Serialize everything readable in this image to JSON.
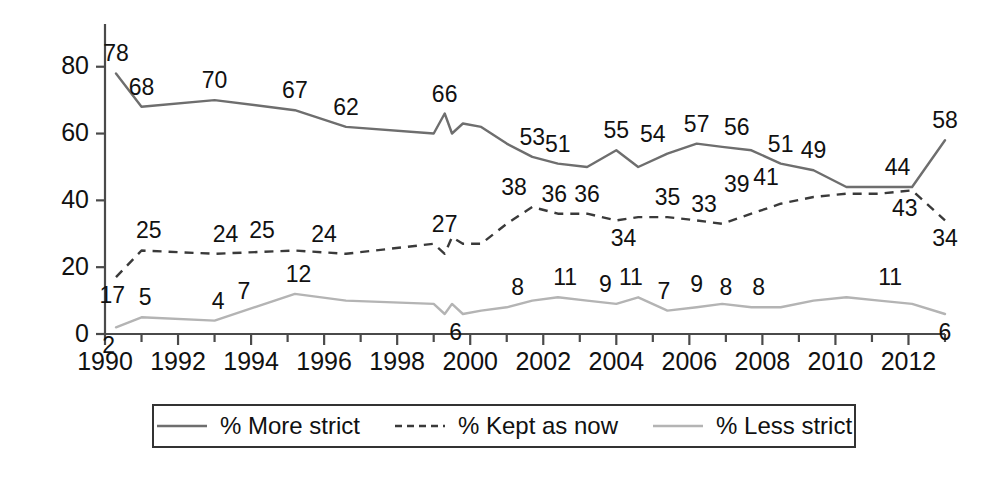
{
  "chart_data": {
    "type": "line",
    "title": "",
    "subtitle": "",
    "xlabel": "",
    "ylabel": "",
    "xlim": [
      1990,
      2013
    ],
    "ylim": [
      0,
      88
    ],
    "yticks": [
      0,
      20,
      40,
      60,
      80
    ],
    "xticks": [
      1990,
      1992,
      1994,
      1996,
      1998,
      2000,
      2002,
      2004,
      2006,
      2008,
      2010,
      2012
    ],
    "grid": false,
    "legend_position": "bottom",
    "x": [
      1990.3,
      1991.0,
      1993.0,
      1995.2,
      1996.6,
      1999.0,
      1999.3,
      1999.5,
      1999.8,
      2000.3,
      2001.0,
      2001.7,
      2002.4,
      2003.2,
      2004.0,
      2004.6,
      2005.4,
      2006.2,
      2006.9,
      2007.7,
      2008.5,
      2009.4,
      2010.3,
      2011.2,
      2012.1,
      2013.0
    ],
    "series": [
      {
        "name": "% More strict",
        "key": "more_strict",
        "color": "#6e6e6e",
        "style": "solid",
        "values": [
          78,
          68,
          70,
          67,
          62,
          60,
          66,
          60,
          63,
          62,
          57,
          53,
          51,
          50,
          55,
          50,
          54,
          57,
          56,
          55,
          51,
          49,
          44,
          44,
          44,
          58
        ],
        "labels": [
          {
            "x": 1990.3,
            "y": 78,
            "text": "78"
          },
          {
            "x": 1991.0,
            "y": 68,
            "text": "68"
          },
          {
            "x": 1993.0,
            "y": 70,
            "text": "70"
          },
          {
            "x": 1995.2,
            "y": 67,
            "text": "67"
          },
          {
            "x": 1996.6,
            "y": 62,
            "text": "62"
          },
          {
            "x": 1999.3,
            "y": 66,
            "text": "66"
          },
          {
            "x": 2001.7,
            "y": 53,
            "text": "53"
          },
          {
            "x": 2002.4,
            "y": 51,
            "text": "51"
          },
          {
            "x": 2004.0,
            "y": 55,
            "text": "55"
          },
          {
            "x": 2005.0,
            "y": 54,
            "text": "54"
          },
          {
            "x": 2006.2,
            "y": 57,
            "text": "57"
          },
          {
            "x": 2007.3,
            "y": 56,
            "text": "56"
          },
          {
            "x": 2008.5,
            "y": 51,
            "text": "51"
          },
          {
            "x": 2009.4,
            "y": 49,
            "text": "49"
          },
          {
            "x": 2011.7,
            "y": 44,
            "text": "44"
          },
          {
            "x": 2013.0,
            "y": 58,
            "text": "58"
          }
        ]
      },
      {
        "name": "% Kept as now",
        "key": "kept_as_now",
        "color": "#3a3a3a",
        "style": "dashed",
        "values": [
          17,
          25,
          24,
          25,
          24,
          27,
          24,
          29,
          27,
          27,
          33,
          38,
          36,
          36,
          34,
          35,
          35,
          34,
          33,
          36,
          39,
          41,
          42,
          42,
          43,
          34
        ],
        "labels": [
          {
            "x": 1990.2,
            "y": 17,
            "text": "17"
          },
          {
            "x": 1991.2,
            "y": 25,
            "text": "25"
          },
          {
            "x": 1993.3,
            "y": 24,
            "text": "24"
          },
          {
            "x": 1994.3,
            "y": 25,
            "text": "25"
          },
          {
            "x": 1996.0,
            "y": 24,
            "text": "24"
          },
          {
            "x": 2001.2,
            "y": 38,
            "text": "38"
          },
          {
            "x": 2002.3,
            "y": 36,
            "text": "36"
          },
          {
            "x": 2003.2,
            "y": 36,
            "text": "36"
          },
          {
            "x": 2004.2,
            "y": 34,
            "text": "34"
          },
          {
            "x": 2005.4,
            "y": 35,
            "text": "35"
          },
          {
            "x": 2006.4,
            "y": 33,
            "text": "33"
          },
          {
            "x": 2007.3,
            "y": 39,
            "text": "39"
          },
          {
            "x": 2008.1,
            "y": 41,
            "text": "41"
          },
          {
            "x": 2011.9,
            "y": 43,
            "text": "43"
          },
          {
            "x": 2013.0,
            "y": 34,
            "text": "34"
          }
        ]
      },
      {
        "name": "% Less strict",
        "key": "less_strict",
        "color": "#b4b4b4",
        "style": "solid",
        "values": [
          2,
          5,
          4,
          12,
          10,
          9,
          6,
          9,
          6,
          7,
          8,
          10,
          11,
          10,
          9,
          11,
          7,
          8,
          9,
          8,
          8,
          10,
          11,
          10,
          9,
          6
        ],
        "labels": [
          {
            "x": 1990.1,
            "y": 2,
            "text": "2"
          },
          {
            "x": 1991.1,
            "y": 5,
            "text": "5"
          },
          {
            "x": 1993.1,
            "y": 4,
            "text": "4"
          },
          {
            "x": 1993.8,
            "y": 7,
            "text": "7"
          },
          {
            "x": 1995.3,
            "y": 12,
            "text": "12"
          },
          {
            "x": 1999.3,
            "y": 27,
            "text": "27"
          },
          {
            "x": 1999.6,
            "y": 6,
            "text": "6"
          },
          {
            "x": 2001.3,
            "y": 8,
            "text": "8"
          },
          {
            "x": 2002.6,
            "y": 11,
            "text": "11"
          },
          {
            "x": 2003.7,
            "y": 9,
            "text": "9"
          },
          {
            "x": 2004.4,
            "y": 11,
            "text": "11"
          },
          {
            "x": 2005.3,
            "y": 7,
            "text": "7"
          },
          {
            "x": 2006.2,
            "y": 9,
            "text": "9"
          },
          {
            "x": 2007.0,
            "y": 8,
            "text": "8"
          },
          {
            "x": 2007.9,
            "y": 8,
            "text": "8"
          },
          {
            "x": 2011.5,
            "y": 11,
            "text": "11"
          },
          {
            "x": 2013.0,
            "y": 6,
            "text": "6"
          }
        ]
      }
    ]
  },
  "legend": {
    "items": [
      {
        "label": "% More strict",
        "swatch": "solid-dark-line-icon"
      },
      {
        "label": "% Kept as now",
        "swatch": "dashed-line-icon"
      },
      {
        "label": "% Less strict",
        "swatch": "solid-light-line-icon"
      }
    ]
  }
}
